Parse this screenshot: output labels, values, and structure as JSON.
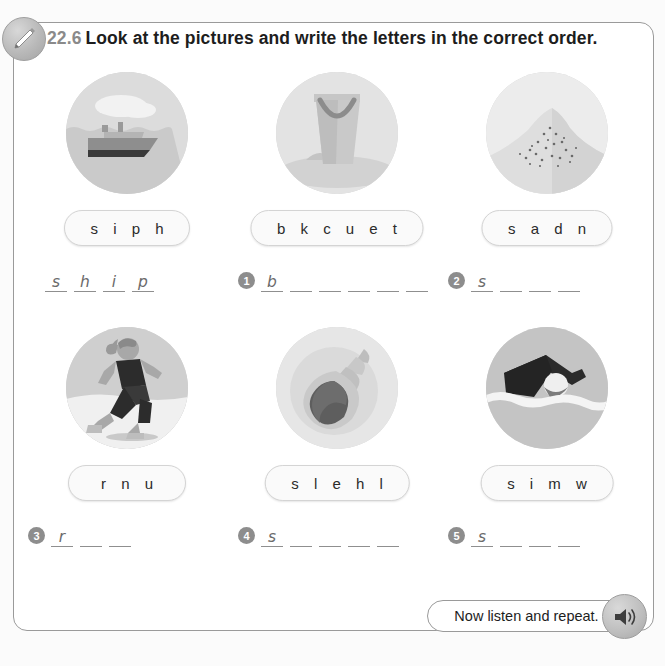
{
  "header": {
    "number": "22.6",
    "title": "Look at the pictures and write the letters in the correct order.",
    "badge_icon": "pencil-icon"
  },
  "footer": {
    "text": "Now listen and repeat.",
    "icon": "speaker-icon"
  },
  "colors": {
    "panel_border": "#9a9a9a",
    "text": "#1d1d1d",
    "number_gray": "#8a8a8a",
    "badge_gray": "#8d8d8d",
    "line_gray": "#8f8f8f",
    "handwriting": "#6b6b6b",
    "pill_bg": "#fafafa",
    "pill_border": "#d4d4d4",
    "circle_bg": "#d2d2d2"
  },
  "exercises": [
    {
      "picture": "ship-icon",
      "picture_label": "ship",
      "scrambled": "s i p h",
      "number": "",
      "is_example": true,
      "letters": [
        "s",
        "h",
        "i",
        "p"
      ],
      "blanks": 4
    },
    {
      "picture": "bucket-icon",
      "picture_label": "bucket",
      "scrambled": "b k c u e t",
      "number": "1",
      "is_example": false,
      "letters": [
        "b",
        "",
        "",
        "",
        "",
        ""
      ],
      "blanks": 6
    },
    {
      "picture": "sand-icon",
      "picture_label": "sand",
      "scrambled": "s a d n",
      "number": "2",
      "is_example": false,
      "letters": [
        "s",
        "",
        "",
        ""
      ],
      "blanks": 4
    },
    {
      "picture": "run-icon",
      "picture_label": "run",
      "scrambled": "r n u",
      "number": "3",
      "is_example": false,
      "letters": [
        "r",
        "",
        ""
      ],
      "blanks": 3
    },
    {
      "picture": "shell-icon",
      "picture_label": "shell",
      "scrambled": "s l e h l",
      "number": "4",
      "is_example": false,
      "letters": [
        "s",
        "",
        "",
        "",
        ""
      ],
      "blanks": 5
    },
    {
      "picture": "swim-icon",
      "picture_label": "swim",
      "scrambled": "s i m w",
      "number": "5",
      "is_example": false,
      "letters": [
        "s",
        "",
        "",
        ""
      ],
      "blanks": 4
    }
  ]
}
